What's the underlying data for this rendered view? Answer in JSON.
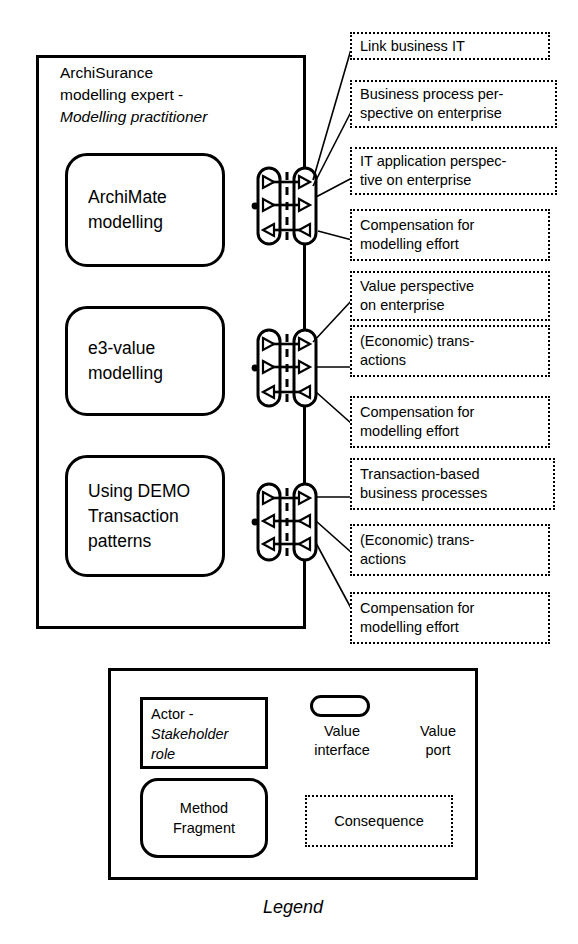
{
  "diagram": {
    "title": "Legend",
    "actor": {
      "name_line1": "ArchiSurance",
      "name_line2": "modelling expert -",
      "role": "Modelling practitioner"
    },
    "fragments": [
      {
        "id": "frag-1",
        "line1": "ArchiMate",
        "line2": "modelling"
      },
      {
        "id": "frag-2",
        "line1": "e3-value",
        "line2": "modelling"
      },
      {
        "id": "frag-3",
        "line1": "Using DEMO",
        "line2": "Transaction",
        "line3": "patterns"
      }
    ],
    "consequences": [
      {
        "line1": "Link business IT",
        "line2": ""
      },
      {
        "line1": "Business process per-",
        "line2": "spective on enterprise"
      },
      {
        "line1": "IT application perspec-",
        "line2": "tive on enterprise"
      },
      {
        "line1": "Compensation for",
        "line2": "modelling effort"
      },
      {
        "line1": "Value perspective",
        "line2": "on enterprise"
      },
      {
        "line1": "(Economic) trans-",
        "line2": "actions"
      },
      {
        "line1": "Compensation for",
        "line2": "modelling effort"
      },
      {
        "line1": "Transaction-based",
        "line2": "business processes"
      },
      {
        "line1": "(Economic) trans-",
        "line2": "actions"
      },
      {
        "line1": "Compensation for",
        "line2": "modelling effort"
      }
    ],
    "legend": {
      "actor_line1": "Actor -",
      "actor_role1": "Stakeholder",
      "actor_role2": "role",
      "fragment_line1": "Method",
      "fragment_line2": "Fragment",
      "value_interface_l1": "Value",
      "value_interface_l2": "interface",
      "value_port_l1": "Value",
      "value_port_l2": "port",
      "consequence": "Consequence",
      "caption": "Legend"
    },
    "colors": {
      "stroke": "#000000",
      "background": "#ffffff"
    }
  }
}
